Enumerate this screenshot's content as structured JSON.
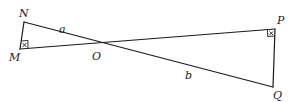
{
  "figure": {
    "points": {
      "N": {
        "label": "N",
        "x": 24,
        "y": 22
      },
      "M": {
        "label": "M",
        "x": 20,
        "y": 49
      },
      "O": {
        "label": "O",
        "x": 96,
        "y": 46
      },
      "P": {
        "label": "P",
        "x": 275,
        "y": 29
      },
      "Q": {
        "label": "Q",
        "x": 273,
        "y": 87
      }
    },
    "segments": [
      {
        "from": "N",
        "to": "Q",
        "label": "",
        "note": "NO labeled a, OQ labeled b"
      },
      {
        "from": "M",
        "to": "P",
        "label": ""
      },
      {
        "from": "N",
        "to": "M",
        "label": ""
      },
      {
        "from": "P",
        "to": "Q",
        "label": ""
      }
    ],
    "segment_labels": {
      "a": "a",
      "b": "b"
    },
    "angle_marks": [
      {
        "vertex": "M",
        "type": "right-angle"
      },
      {
        "vertex": "P",
        "type": "right-angle"
      }
    ],
    "stroke_color": "#1a1a1a",
    "background": "#ffffff"
  }
}
